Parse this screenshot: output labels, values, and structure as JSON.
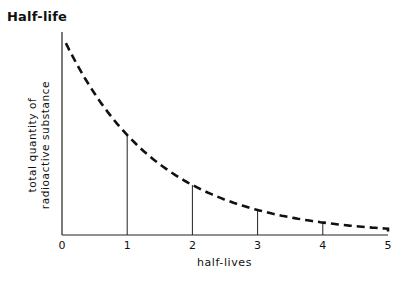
{
  "title": "Half-life",
  "chart_data": {
    "type": "line",
    "title": "Half-life",
    "xlabel": "half-lives",
    "ylabel": "total quantity of radioactive substance",
    "ylabel_lines": [
      "total quantity of",
      "radioactive substance"
    ],
    "x": [
      0,
      1,
      2,
      3,
      4,
      5
    ],
    "x_tick_labels": [
      "0",
      "1",
      "2",
      "3",
      "4",
      "5"
    ],
    "series": [
      {
        "name": "radioactive substance remaining",
        "style": "dashed",
        "values": [
          1.0,
          0.5,
          0.25,
          0.125,
          0.0625,
          0.03125
        ]
      }
    ],
    "vertical_markers_at": [
      1,
      2,
      3,
      4
    ],
    "xlim": [
      0,
      5
    ],
    "ylim": [
      0,
      1
    ],
    "grid": false,
    "legend": "none"
  }
}
